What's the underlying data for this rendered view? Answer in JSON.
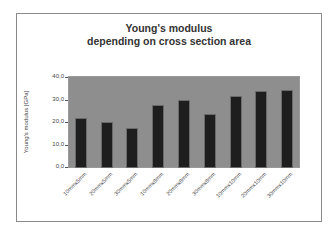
{
  "chart_data": {
    "type": "bar",
    "title": "Young's modulus depending on cross section area",
    "title_lines": [
      "Young's modulus",
      "depending on cross section area"
    ],
    "xlabel": "",
    "ylabel": "Young's modulus [GPa]",
    "ylim": [
      0,
      40
    ],
    "yticks": [
      "0,0",
      "10,0",
      "20,0",
      "30,0",
      "40,0"
    ],
    "categories": [
      "10mmx5mm",
      "20mmx5mm",
      "30mmx5mm",
      "10mmx8mm",
      "20mmx8mm",
      "30mmx8mm",
      "10mmx10mm",
      "20mmx10mm",
      "30mmx10mm"
    ],
    "values": [
      21.5,
      19.5,
      17.0,
      27.0,
      29.5,
      23.0,
      31.0,
      33.5,
      34.0
    ],
    "grid": false,
    "legend": "none",
    "colors": {
      "bar": "#1e1e1e",
      "plot_background": "#8e8e8e",
      "frame": "#8a8a8a"
    }
  }
}
